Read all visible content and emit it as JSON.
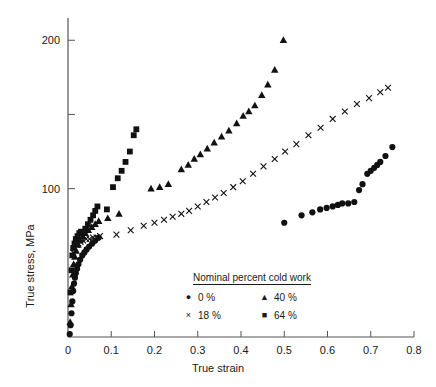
{
  "chart_data": {
    "type": "scatter",
    "title": "",
    "xlabel": "True strain",
    "ylabel": "True stress, MPa",
    "xlim": [
      0,
      0.8
    ],
    "ylim": [
      0,
      215
    ],
    "grid": false,
    "x_ticks": [
      "0",
      "0.1",
      "0.2",
      "0.3",
      "0.4",
      "0.5",
      "0.6",
      "0.7",
      "0.8"
    ],
    "x_tick_values": [
      0,
      0.1,
      0.2,
      0.3,
      0.4,
      0.5,
      0.6,
      0.7,
      0.8
    ],
    "y_ticks": [
      "100",
      "200"
    ],
    "y_tick_values": [
      100,
      200
    ],
    "y_minor_ticks": [
      50,
      150
    ],
    "legend": {
      "title": "Nominal percent cold work",
      "position": "lower-center",
      "entries": [
        {
          "label": "0 %",
          "marker": "circle"
        },
        {
          "label": "40 %",
          "marker": "triangle"
        },
        {
          "label": "18 %",
          "marker": "cross"
        },
        {
          "label": "64 %",
          "marker": "square"
        }
      ]
    },
    "series": [
      {
        "name": "0 %",
        "marker": "circle",
        "points": [
          [
            0.004,
            2
          ],
          [
            0.006,
            8
          ],
          [
            0.008,
            16
          ],
          [
            0.01,
            24
          ],
          [
            0.012,
            31
          ],
          [
            0.014,
            36
          ],
          [
            0.016,
            40
          ],
          [
            0.018,
            43
          ],
          [
            0.021,
            46
          ],
          [
            0.024,
            49
          ],
          [
            0.028,
            52
          ],
          [
            0.033,
            55
          ],
          [
            0.038,
            57
          ],
          [
            0.043,
            59
          ],
          [
            0.049,
            61
          ],
          [
            0.056,
            63
          ],
          [
            0.063,
            65
          ],
          [
            0.071,
            67
          ],
          [
            0.5,
            77
          ],
          [
            0.54,
            82
          ],
          [
            0.565,
            84
          ],
          [
            0.583,
            86
          ],
          [
            0.598,
            87
          ],
          [
            0.612,
            88
          ],
          [
            0.624,
            89
          ],
          [
            0.634,
            90
          ],
          [
            0.648,
            90
          ],
          [
            0.662,
            91
          ],
          [
            0.673,
            99
          ],
          [
            0.681,
            103
          ],
          [
            0.692,
            110
          ],
          [
            0.7,
            112
          ],
          [
            0.708,
            114
          ],
          [
            0.715,
            116
          ],
          [
            0.722,
            118
          ],
          [
            0.734,
            122
          ],
          [
            0.75,
            128
          ]
        ]
      },
      {
        "name": "18 %",
        "marker": "cross",
        "points": [
          [
            0.012,
            57
          ],
          [
            0.016,
            60
          ],
          [
            0.02,
            62
          ],
          [
            0.024,
            63
          ],
          [
            0.029,
            64
          ],
          [
            0.035,
            65
          ],
          [
            0.042,
            66
          ],
          [
            0.05,
            66
          ],
          [
            0.058,
            67
          ],
          [
            0.066,
            67
          ],
          [
            0.074,
            68
          ],
          [
            0.112,
            69
          ],
          [
            0.145,
            72
          ],
          [
            0.175,
            75
          ],
          [
            0.2,
            77
          ],
          [
            0.222,
            79
          ],
          [
            0.242,
            81
          ],
          [
            0.262,
            83
          ],
          [
            0.28,
            85
          ],
          [
            0.3,
            88
          ],
          [
            0.32,
            91
          ],
          [
            0.34,
            94
          ],
          [
            0.36,
            97
          ],
          [
            0.382,
            101
          ],
          [
            0.404,
            105
          ],
          [
            0.428,
            110
          ],
          [
            0.452,
            115
          ],
          [
            0.478,
            120
          ],
          [
            0.502,
            125
          ],
          [
            0.528,
            130
          ],
          [
            0.556,
            136
          ],
          [
            0.584,
            141
          ],
          [
            0.612,
            147
          ],
          [
            0.64,
            152
          ],
          [
            0.668,
            157
          ],
          [
            0.696,
            161
          ],
          [
            0.722,
            165
          ],
          [
            0.74,
            168
          ]
        ]
      },
      {
        "name": "40 %",
        "marker": "triangle",
        "points": [
          [
            0.005,
            10
          ],
          [
            0.007,
            22
          ],
          [
            0.009,
            34
          ],
          [
            0.011,
            42
          ],
          [
            0.013,
            49
          ],
          [
            0.016,
            54
          ],
          [
            0.019,
            58
          ],
          [
            0.023,
            62
          ],
          [
            0.028,
            65
          ],
          [
            0.034,
            68
          ],
          [
            0.04,
            70
          ],
          [
            0.047,
            72
          ],
          [
            0.055,
            74
          ],
          [
            0.063,
            76
          ],
          [
            0.071,
            78
          ],
          [
            0.092,
            80
          ],
          [
            0.118,
            83
          ],
          [
            0.192,
            100
          ],
          [
            0.212,
            101
          ],
          [
            0.232,
            103
          ],
          [
            0.262,
            113
          ],
          [
            0.278,
            116
          ],
          [
            0.292,
            120
          ],
          [
            0.306,
            123
          ],
          [
            0.322,
            127
          ],
          [
            0.338,
            131
          ],
          [
            0.355,
            135
          ],
          [
            0.372,
            139
          ],
          [
            0.39,
            144
          ],
          [
            0.405,
            149
          ],
          [
            0.418,
            152
          ],
          [
            0.432,
            156
          ],
          [
            0.448,
            163
          ],
          [
            0.462,
            170
          ],
          [
            0.478,
            180
          ],
          [
            0.498,
            200
          ]
        ]
      },
      {
        "name": "64 %",
        "marker": "square",
        "points": [
          [
            0.006,
            30
          ],
          [
            0.008,
            45
          ],
          [
            0.01,
            55
          ],
          [
            0.012,
            60
          ],
          [
            0.015,
            63
          ],
          [
            0.018,
            66
          ],
          [
            0.022,
            68
          ],
          [
            0.026,
            70
          ],
          [
            0.03,
            71
          ],
          [
            0.04,
            73
          ],
          [
            0.046,
            76
          ],
          [
            0.052,
            79
          ],
          [
            0.058,
            82
          ],
          [
            0.063,
            85
          ],
          [
            0.068,
            88
          ],
          [
            0.09,
            86
          ],
          [
            0.104,
            101
          ],
          [
            0.115,
            107
          ],
          [
            0.124,
            112
          ],
          [
            0.133,
            118
          ],
          [
            0.143,
            125
          ],
          [
            0.152,
            136
          ],
          [
            0.158,
            140
          ]
        ]
      }
    ]
  }
}
